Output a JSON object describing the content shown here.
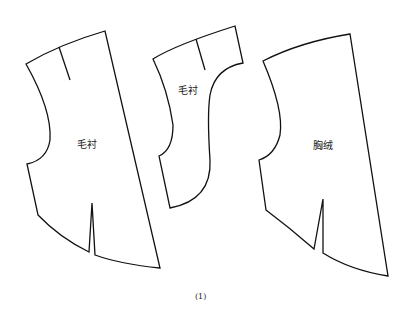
{
  "figure": {
    "caption": "(1)",
    "pieces": [
      {
        "id": "left",
        "label": "毛衬"
      },
      {
        "id": "middle",
        "label": "毛衬"
      },
      {
        "id": "right",
        "label": "胸绒"
      }
    ]
  },
  "colors": {
    "stroke": "#111111",
    "background": "#ffffff"
  }
}
